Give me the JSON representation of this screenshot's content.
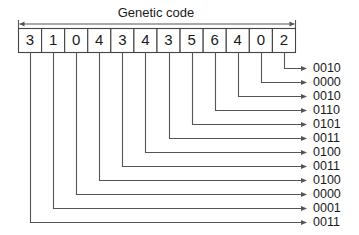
{
  "diagram": {
    "title": "Genetic code",
    "span_arrow": "double-headed",
    "colors": {
      "stroke": "#555555",
      "box_stroke": "#444444",
      "text": "#1a1a1a",
      "background": "#ffffff"
    },
    "boxes": [
      {
        "index": 0,
        "digit": "3",
        "code": "0011"
      },
      {
        "index": 1,
        "digit": "1",
        "code": "0001"
      },
      {
        "index": 2,
        "digit": "0",
        "code": "0000"
      },
      {
        "index": 3,
        "digit": "4",
        "code": "0100"
      },
      {
        "index": 4,
        "digit": "3",
        "code": "0011"
      },
      {
        "index": 5,
        "digit": "4",
        "code": "0100"
      },
      {
        "index": 6,
        "digit": "3",
        "code": "0011"
      },
      {
        "index": 7,
        "digit": "5",
        "code": "0101"
      },
      {
        "index": 8,
        "digit": "6",
        "code": "0110"
      },
      {
        "index": 9,
        "digit": "4",
        "code": "0010"
      },
      {
        "index": 10,
        "digit": "0",
        "code": "0000"
      },
      {
        "index": 11,
        "digit": "2",
        "code": "0010"
      }
    ],
    "digit_sequence": [
      "3",
      "1",
      "0",
      "4",
      "3",
      "4",
      "3",
      "5",
      "6",
      "4",
      "0",
      "2"
    ],
    "code_labels_top_to_bottom": [
      "0010",
      "0000",
      "0010",
      "0110",
      "0101",
      "0011",
      "0100",
      "0011",
      "0100",
      "0000",
      "0001",
      "0011"
    ]
  }
}
